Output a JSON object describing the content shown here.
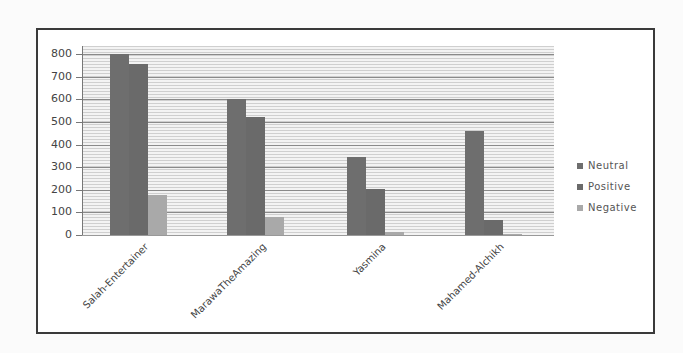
{
  "chart_data": {
    "type": "bar",
    "title": "",
    "xlabel": "",
    "ylabel": "",
    "ylim": [
      0,
      800
    ],
    "yticks": [
      0,
      100,
      200,
      300,
      400,
      500,
      600,
      700,
      800
    ],
    "grid": true,
    "legend_position": "right",
    "categories": [
      "Salah-Entertainer",
      "MarawaTheAmazing",
      "Yasmina",
      "Mahamed-Alchikh"
    ],
    "series": [
      {
        "name": "Neutral",
        "color": "#6e6e6e",
        "values": [
          800,
          600,
          345,
          460
        ]
      },
      {
        "name": "Positive",
        "color": "#6a6a6a",
        "values": [
          755,
          520,
          205,
          65
        ]
      },
      {
        "name": "Negative",
        "color": "#a9a9a9",
        "values": [
          175,
          80,
          15,
          5
        ]
      }
    ]
  },
  "yaxis": {
    "labels": [
      "800",
      "700",
      "600",
      "500",
      "400",
      "300",
      "200",
      "100",
      "0"
    ]
  },
  "legend": {
    "items": [
      {
        "label": "Neutral"
      },
      {
        "label": "Positive"
      },
      {
        "label": "Negative"
      }
    ]
  }
}
